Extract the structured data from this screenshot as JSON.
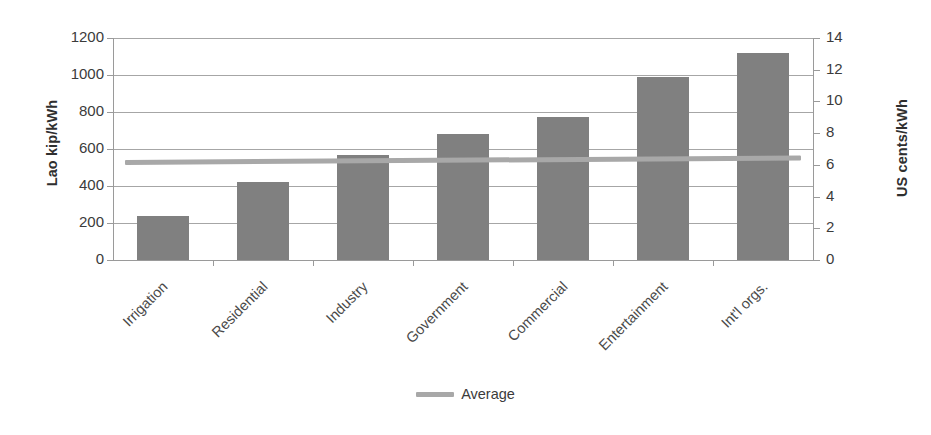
{
  "chart_data": {
    "type": "bar",
    "title": "",
    "categories": [
      "Irrigation",
      "Residential",
      "Industry",
      "Government",
      "Commercial",
      "Entertainment",
      "Int'l orgs."
    ],
    "series": [
      {
        "name": "Tariff",
        "type": "bar",
        "values": [
          240,
          420,
          570,
          680,
          775,
          990,
          1120
        ],
        "color": "#808080",
        "axis": "left"
      },
      {
        "name": "Average",
        "type": "line",
        "values": [
          540,
          544,
          548,
          552,
          556,
          560,
          565
        ],
        "color": "#a8a8a8",
        "axis": "left"
      }
    ],
    "xlabel": "",
    "ylabel": "Lao kip/kWh",
    "y2label": "US cents/kWh",
    "ylim": [
      0,
      1200
    ],
    "y2lim": [
      0,
      14
    ],
    "yticks": [
      0,
      200,
      400,
      600,
      800,
      1000,
      1200
    ],
    "y2ticks": [
      0,
      2,
      4,
      6,
      8,
      10,
      12,
      14
    ],
    "ytick_labels": [
      "0",
      "200",
      "400",
      "600",
      "800",
      "1000",
      "1200"
    ],
    "y2tick_labels": [
      "0",
      "2",
      "4",
      "6",
      "8",
      "10",
      "12",
      "14"
    ],
    "grid": true,
    "grid_axis": "y",
    "legend": {
      "position": "bottom",
      "entries": [
        {
          "label": "Average",
          "marker": "line",
          "color": "#a8a8a8"
        }
      ]
    },
    "colors": {
      "bar": "#808080",
      "average_line": "#a8a8a8",
      "gridline": "#a6a6a6",
      "axis": "#9a9a9a",
      "text": "#3b3b3b",
      "background": "#ffffff"
    }
  }
}
